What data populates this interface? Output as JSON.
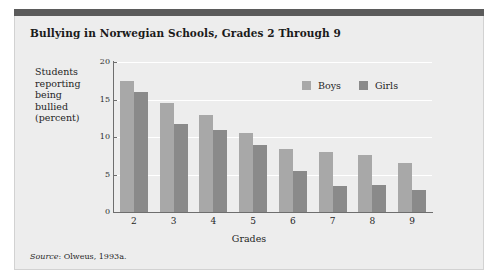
{
  "figure": {
    "title": "Bullying in Norwegian Schools, Grades 2 Through 9",
    "source_word": "Source",
    "source_rest": ": Olweus, 1993a."
  },
  "colors": {
    "boys": "#a8a8a8",
    "girls": "#8a8a8a",
    "panel_background": "#ededed",
    "top_rule": "#5b5b5b",
    "gridline": "#ffffff",
    "axis": "#6e6e6e"
  },
  "chart_data": {
    "type": "bar",
    "title": "Bullying in Norwegian Schools, Grades 2 Through 9",
    "xlabel": "Grades",
    "ylabel": "Students reporting being bullied (percent)",
    "ylabel_lines": [
      "Students",
      "reporting",
      "being",
      "bullied",
      "(percent)"
    ],
    "categories": [
      "2",
      "3",
      "4",
      "5",
      "6",
      "7",
      "8",
      "9"
    ],
    "series": [
      {
        "name": "Boys",
        "color": "#a8a8a8",
        "values": [
          17.5,
          14.5,
          13.0,
          10.6,
          8.4,
          8.0,
          7.6,
          6.5
        ]
      },
      {
        "name": "Girls",
        "color": "#8a8a8a",
        "values": [
          16.0,
          11.8,
          11.0,
          9.0,
          5.5,
          3.5,
          3.6,
          3.0
        ]
      }
    ],
    "ylim": [
      0,
      20
    ],
    "yticks": [
      0,
      5,
      10,
      15,
      20
    ],
    "ytick_labels": [
      "0",
      "5",
      "10",
      "15",
      "20"
    ],
    "grid": true,
    "legend_position": "upper-right-inside",
    "source": "Source: Olweus, 1993a."
  }
}
